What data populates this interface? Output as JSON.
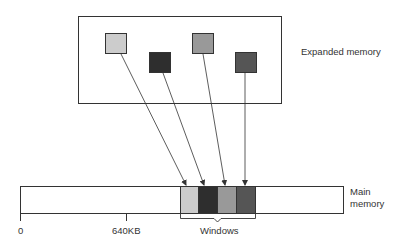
{
  "labels": {
    "expanded_memory": "Expanded memory",
    "main_memory_line1": "Main",
    "main_memory_line2": "memory",
    "tick_zero": "0",
    "tick_640": "640KB",
    "windows": "Windows"
  },
  "expanded_pages": [
    {
      "fill": "#cccccc",
      "x": 105,
      "y": 33
    },
    {
      "fill": "#2e2e2e",
      "x": 149,
      "y": 52
    },
    {
      "fill": "#999999",
      "x": 192,
      "y": 33
    },
    {
      "fill": "#555555",
      "x": 235,
      "y": 52
    }
  ],
  "window_slots": [
    {
      "fill": "#cccccc"
    },
    {
      "fill": "#2e2e2e"
    },
    {
      "fill": "#999999"
    },
    {
      "fill": "#555555"
    }
  ],
  "colors": {
    "stroke": "#333333"
  }
}
